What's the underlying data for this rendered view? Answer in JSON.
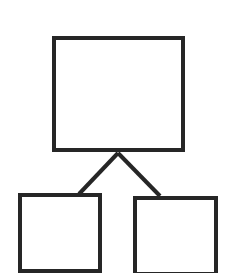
{
  "canvas": {
    "width": 234,
    "height": 273,
    "background_color": "#ffffff"
  },
  "diagram": {
    "type": "hierarchy-tree",
    "title": "",
    "stroke_color": "#262626",
    "fill_color": "#ffffff",
    "node_count": 3,
    "edge_count": 2,
    "nodes": [
      {
        "id": "root",
        "role": "parent",
        "label": "",
        "x": 52,
        "y": 36,
        "width": 133,
        "height": 116,
        "stroke_width": 4
      },
      {
        "id": "child-left",
        "role": "child",
        "label": "",
        "x": 18,
        "y": 193,
        "width": 84,
        "height": 80,
        "stroke_width": 4
      },
      {
        "id": "child-right",
        "role": "child",
        "label": "",
        "x": 133,
        "y": 196,
        "width": 85,
        "height": 80,
        "stroke_width": 4
      }
    ],
    "edges": [
      {
        "id": "edge-root-to-left",
        "from": "root",
        "to": "child-left",
        "x1": 118,
        "y1": 153,
        "x2": 79,
        "y2": 194,
        "stroke_width": 4
      },
      {
        "id": "edge-root-to-right",
        "from": "root",
        "to": "child-right",
        "x1": 118,
        "y1": 153,
        "x2": 160,
        "y2": 196,
        "stroke_width": 4
      }
    ]
  }
}
